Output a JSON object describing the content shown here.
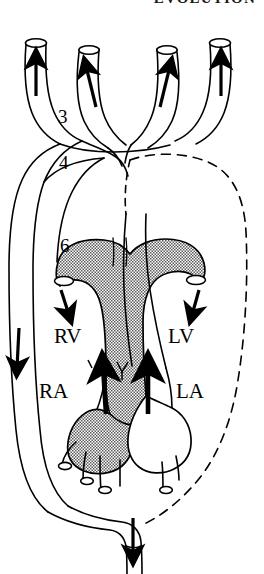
{
  "page": {
    "running_head": "EVOLUTION",
    "background_color": "#ffffff",
    "ink_color": "#000000",
    "shading_color": "#9a9a9a"
  },
  "figure": {
    "name": "aortic-arch-and-heart-diagram",
    "arch_labels": [
      {
        "id": "arch-3",
        "text": "3",
        "x": 64,
        "y": 119
      },
      {
        "id": "arch-4",
        "text": "4",
        "x": 65,
        "y": 165
      },
      {
        "id": "arch-6",
        "text": "6",
        "x": 66,
        "y": 248
      }
    ],
    "chamber_labels": [
      {
        "id": "right-ventricle",
        "text": "RV",
        "x": 55,
        "y": 339
      },
      {
        "id": "left-ventricle",
        "text": "LV",
        "x": 168,
        "y": 339
      },
      {
        "id": "right-atrium",
        "text": "RA",
        "x": 40,
        "y": 394
      },
      {
        "id": "left-atrium",
        "text": "LA",
        "x": 176,
        "y": 394
      }
    ],
    "flow_arrows": [
      {
        "id": "carotid-arrow-1",
        "direction": "up",
        "x": 35,
        "y": 55
      },
      {
        "id": "carotid-arrow-2",
        "direction": "up",
        "x": 89,
        "y": 62
      },
      {
        "id": "carotid-arrow-3",
        "direction": "up",
        "x": 167,
        "y": 62
      },
      {
        "id": "carotid-arrow-4",
        "direction": "up",
        "x": 221,
        "y": 55
      },
      {
        "id": "pulmonary-left-arrow",
        "direction": "down",
        "x": 66,
        "y": 292
      },
      {
        "id": "pulmonary-right-arrow",
        "direction": "down",
        "x": 196,
        "y": 292
      },
      {
        "id": "systemic-descending-arrow",
        "direction": "down",
        "x": 17,
        "y": 352
      },
      {
        "id": "right-atrium-to-ventricle-arrow",
        "direction": "up",
        "x": 105,
        "y": 380
      },
      {
        "id": "left-atrium-to-ventricle-arrow",
        "direction": "up",
        "x": 148,
        "y": 380
      },
      {
        "id": "dorsal-aorta-arrow",
        "direction": "down",
        "x": 131,
        "y": 540
      }
    ]
  }
}
